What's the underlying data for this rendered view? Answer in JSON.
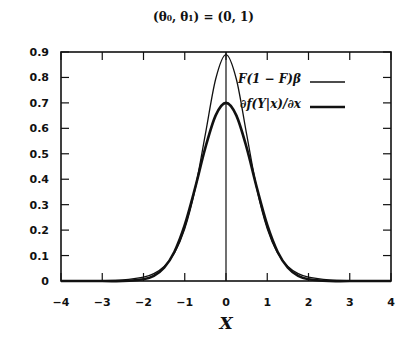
{
  "chart_data": {
    "type": "line",
    "title": "(θ₀, θ₁) = (0, 1)",
    "xlabel": "X",
    "ylabel": "",
    "xlim": [
      -4,
      4
    ],
    "ylim": [
      0,
      0.9
    ],
    "xticks": [
      "−4",
      "−3",
      "−2",
      "−1",
      "0",
      "1",
      "2",
      "3",
      "4"
    ],
    "yticks": [
      "0",
      "0.1",
      "0.2",
      "0.3",
      "0.4",
      "0.5",
      "0.6",
      "0.7",
      "0.8",
      "0.9"
    ],
    "grid": false,
    "legend_position": "upper right",
    "annotations": [
      "vertical line at x = 0"
    ],
    "x": [
      -4,
      -3,
      -2.5,
      -2,
      -1.75,
      -1.5,
      -1.25,
      -1,
      -0.75,
      -0.5,
      -0.25,
      0,
      0.25,
      0.5,
      0.75,
      1,
      1.25,
      1.5,
      1.75,
      2,
      2.5,
      3,
      4
    ],
    "series": [
      {
        "name": "F(1 − F)β",
        "style": "thin",
        "values": [
          0.0,
          0.001,
          0.004,
          0.015,
          0.029,
          0.057,
          0.11,
          0.205,
          0.36,
          0.577,
          0.794,
          0.89,
          0.794,
          0.577,
          0.36,
          0.205,
          0.11,
          0.057,
          0.029,
          0.015,
          0.004,
          0.001,
          0.0
        ]
      },
      {
        "name": "∂f(Y|x)/∂x",
        "style": "thick",
        "values": [
          0.0,
          0.0,
          0.0,
          0.007,
          0.02,
          0.052,
          0.115,
          0.22,
          0.365,
          0.524,
          0.651,
          0.7,
          0.651,
          0.524,
          0.365,
          0.22,
          0.115,
          0.052,
          0.02,
          0.007,
          0.0,
          0.0,
          0.0
        ]
      }
    ]
  },
  "labels": {
    "title": "(θ₀, θ₁) = (0, 1)",
    "xlabel": "X",
    "legend_1": "F(1 − F)β",
    "legend_2": "∂f(Y|x)/∂x"
  }
}
